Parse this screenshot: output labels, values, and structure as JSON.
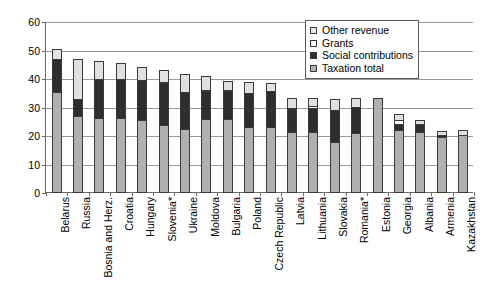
{
  "chart_data": {
    "type": "bar",
    "stacked": true,
    "title": "",
    "subtitle": "",
    "xlabel": "",
    "ylabel": "",
    "ylim": [
      0,
      60
    ],
    "yticks": [
      0,
      10,
      20,
      30,
      40,
      50,
      60
    ],
    "grid": true,
    "legend_position": "top-right",
    "categories": [
      "Belarus",
      "Russia",
      "Bosnia and Herz.",
      "Croatia",
      "Hungary",
      "Slovenia*",
      "Ukraine",
      "Moldova",
      "Bulgaria",
      "Poland",
      "Czech Republic",
      "Latvia",
      "Lithuania",
      "Slovakia",
      "Romania*",
      "Estonia",
      "Georgia",
      "Albania",
      "Armenia",
      "Kazakhstan"
    ],
    "series": [
      {
        "name": "Taxation total",
        "color": "#b0b0b0",
        "values": [
          35.5,
          27.0,
          26.2,
          26.3,
          25.7,
          23.7,
          22.5,
          25.8,
          26.1,
          23.2,
          23.0,
          21.5,
          21.4,
          18.0,
          20.9,
          33.3,
          22.2,
          21.5,
          19.6,
          20.4
        ]
      },
      {
        "name": "Social contributions",
        "color": "#2e2e2e",
        "values": [
          12.0,
          6.4,
          14.3,
          14.1,
          14.2,
          15.1,
          13.4,
          10.2,
          10.2,
          12.3,
          13.0,
          8.3,
          8.9,
          11.6,
          9.8,
          0.0,
          2.3,
          3.1,
          1.0,
          0.0
        ]
      },
      {
        "name": "Grants",
        "color": "#ffffff",
        "values": [
          0.0,
          0.0,
          0.0,
          0.0,
          0.0,
          0.7,
          0.0,
          0.9,
          0.6,
          0.0,
          0.0,
          0.9,
          0.8,
          0.0,
          0.0,
          0.0,
          1.7,
          0.0,
          0.0,
          0.0
        ]
      },
      {
        "name": "Other revenue",
        "color": "#e0e0e0",
        "values": [
          3.6,
          14.5,
          6.6,
          5.9,
          5.0,
          4.6,
          6.6,
          5.1,
          3.5,
          4.3,
          3.3,
          3.6,
          3.3,
          4.1,
          3.3,
          0.0,
          2.6,
          1.8,
          1.9,
          2.0
        ]
      }
    ],
    "totals": [
      51.1,
      47.9,
      47.1,
      46.3,
      44.9,
      44.1,
      42.5,
      42.0,
      40.4,
      39.8,
      39.3,
      34.3,
      34.4,
      33.7,
      34.0,
      33.3,
      28.8,
      26.4,
      22.5,
      22.4
    ]
  },
  "legend": {
    "items": [
      {
        "label": "Other revenue",
        "swatch": "other"
      },
      {
        "label": "Grants",
        "swatch": "grants"
      },
      {
        "label": "Social contributions",
        "swatch": "social"
      },
      {
        "label": "Taxation total",
        "swatch": "tax"
      }
    ]
  },
  "axis": {
    "y_tick_labels": [
      "0",
      "10",
      "20",
      "30",
      "40",
      "50",
      "60"
    ]
  }
}
